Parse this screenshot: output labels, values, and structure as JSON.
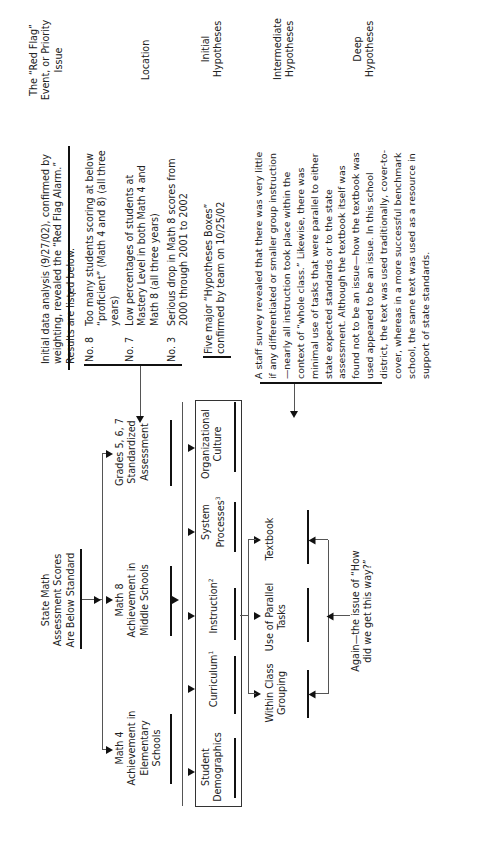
{
  "labels": {
    "red_flag": "The “Red Flag” Event, or Priority Issue",
    "location": "Location",
    "initial": "Initial Hypotheses",
    "intermediate": "Intermediate Hypotheses",
    "deep": "Deep Hypotheses"
  },
  "red_flag": {
    "intro": "Initial data analysis (9/27/02), confirmed by weighting, revealed the “Red Flag Alarm.” Results are listed below.",
    "items": [
      {
        "rank": "No. 8",
        "text": "Too many students scoring at below “proficient” (Math 4 and 8) (all three years)"
      },
      {
        "rank": "No. 7",
        "text": "Low percentages of students at Mastery Level in both Math 4 and Math 8 (all three years)"
      },
      {
        "rank": "No. 3",
        "text": "Serious drop in Math 8 scores from 2000 through 2001 to 2002"
      }
    ]
  },
  "tree": {
    "root": "State Math Assessment Scores Are Below Standard",
    "locations": [
      "Math 4 Achievement in Elementary Schools",
      "Math 8 Achievement in Middle Schools",
      "Grades 5, 6, 7 Standardized Assessment"
    ],
    "hypotheses_note": "Five major “Hypotheses Boxes” confirmed by team on 10/25/02",
    "initial": [
      {
        "label": "Student Demographics",
        "sup": ""
      },
      {
        "label": "Curriculum",
        "sup": "1"
      },
      {
        "label": "Instruction",
        "sup": "2"
      },
      {
        "label": "System Processes",
        "sup": "3"
      },
      {
        "label": "Organizational Culture",
        "sup": ""
      }
    ],
    "intermediate": [
      "Within Class Grouping",
      "Use of Parallel Tasks",
      "Textbook"
    ],
    "deep_note": "Again—the issue of “How did we get this way?”",
    "survey": "A staff survey revealed that there was very little if any differentiated or smaller group instruction—nearly all instruction took place within the context of “whole class.” Likewise, there was minimal use of tasks that were parallel to either state expected standards or to the state assessment. Although the textbook itself was found not to be an issue—how the textbook was used appeared to be an issue. In this school district, the text was used traditionally, cover-to-cover, whereas in a more successful benchmark school, the same text was used as a resource in support of state standards."
  }
}
